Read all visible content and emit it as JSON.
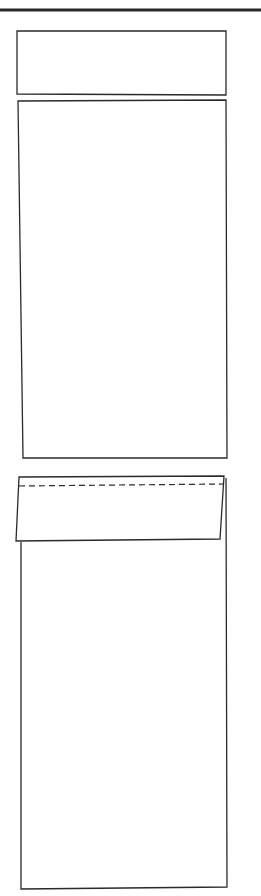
{
  "diagram": {
    "type": "line-drawing",
    "stroke_color": "#2a2a2a",
    "background": "#ffffff",
    "rule": {
      "x1": 0,
      "y1": 10,
      "x2": 261,
      "y2": 10,
      "width": 3
    },
    "panels": [
      {
        "name": "panel-top",
        "points": "17,31 226,31 226,95 17,94"
      },
      {
        "name": "panel-middle",
        "points": "18,101 226,100 227,458 23,458"
      },
      {
        "name": "panel-bottom-body",
        "points": "21,542 21,889 227,887 226,478"
      },
      {
        "name": "panel-bottom-flap",
        "points": "19,477 224,476 220,539 16,541"
      }
    ],
    "fold_line": {
      "x1": 19,
      "y1": 486,
      "x2": 224,
      "y2": 484,
      "dash": "6,4"
    }
  }
}
